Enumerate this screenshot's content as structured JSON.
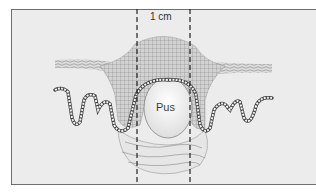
{
  "diagram": {
    "labels": {
      "measurement": "1 cm",
      "center": "Pus"
    },
    "colors": {
      "background": "#ececec",
      "frame": "#6e6e6e",
      "tissue": "#c8c8c8",
      "line": "#444444",
      "pus": "#f4f4f4"
    },
    "dashed_lines_x": [
      137,
      190
    ]
  }
}
